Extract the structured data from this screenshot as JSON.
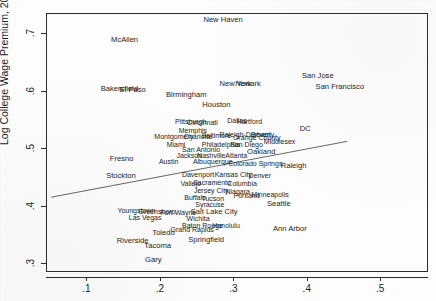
{
  "figure": {
    "kind": "scatter-with-fit-line",
    "background_color": "#fdfdfd",
    "frame_color": "#2b2b2b",
    "label_color": "#1c1c1c"
  },
  "axes": {
    "y_title": "Log College Wage Premium, 2000",
    "x_title": "",
    "x_ticks": [
      ".1",
      ".2",
      ".3",
      ".4",
      ".5"
    ],
    "y_ticks": [
      ".3",
      ".4",
      ".5",
      ".6",
      ".7"
    ]
  },
  "chart_data": {
    "type": "scatter",
    "title": "",
    "xlabel": "",
    "ylabel": "Log College Wage Premium, 2000",
    "xlim": [
      0.045,
      0.565
    ],
    "ylim": [
      0.285,
      0.735
    ],
    "xtick_values": [
      0.1,
      0.2,
      0.3,
      0.4,
      0.5
    ],
    "xtick_labels": [
      ".1",
      ".2",
      ".3",
      ".4",
      ".5"
    ],
    "ytick_values": [
      0.3,
      0.4,
      0.5,
      0.6,
      0.7
    ],
    "ytick_labels": [
      ".3",
      ".4",
      ".5",
      ".6",
      ".7"
    ],
    "grid": false,
    "legend": false,
    "marker_style": "text-label",
    "fit_line": {
      "present": true,
      "x_start": 0.052,
      "y_start": 0.415,
      "x_end": 0.455,
      "y_end": 0.512,
      "color": "#555555"
    },
    "points": [
      {
        "label": "New Haven",
        "x": 0.286,
        "y": 0.722,
        "size": 7.6
      },
      {
        "label": "McAllen",
        "x": 0.152,
        "y": 0.688,
        "size": 7.6
      },
      {
        "label": "Bakersfield",
        "x": 0.145,
        "y": 0.603,
        "size": 7.6
      },
      {
        "label": "El Paso",
        "x": 0.163,
        "y": 0.601,
        "size": 7.6
      },
      {
        "label": "San Jose",
        "x": 0.415,
        "y": 0.625,
        "size": 7.6
      },
      {
        "label": "San Francisco",
        "x": 0.445,
        "y": 0.606,
        "size": 7.6
      },
      {
        "label": "Birmingham",
        "x": 0.236,
        "y": 0.592,
        "size": 7.6
      },
      {
        "label": "New York",
        "x": 0.303,
        "y": 0.612,
        "size": 7.6
      },
      {
        "label": "Newark",
        "x": 0.32,
        "y": 0.612,
        "size": 7.6
      },
      {
        "label": "Houston",
        "x": 0.277,
        "y": 0.576,
        "size": 7.6
      },
      {
        "label": "Pittsburgh",
        "x": 0.242,
        "y": 0.548,
        "size": 7.0
      },
      {
        "label": "Cincinnati",
        "x": 0.258,
        "y": 0.545,
        "size": 7.0
      },
      {
        "label": "Dallas",
        "x": 0.305,
        "y": 0.549,
        "size": 7.0
      },
      {
        "label": "Hartford",
        "x": 0.322,
        "y": 0.548,
        "size": 7.0
      },
      {
        "label": "Memphis",
        "x": 0.245,
        "y": 0.531,
        "size": 7.0
      },
      {
        "label": "Montgomery",
        "x": 0.219,
        "y": 0.521,
        "size": 7.0
      },
      {
        "label": "Charlotte",
        "x": 0.252,
        "y": 0.522,
        "size": 7.0
      },
      {
        "label": "Baltimore",
        "x": 0.277,
        "y": 0.523,
        "size": 7.0
      },
      {
        "label": "Raleigh-Durham",
        "x": 0.316,
        "y": 0.525,
        "size": 7.0
      },
      {
        "label": "Beverly",
        "x": 0.34,
        "y": 0.524,
        "size": 7.0
      },
      {
        "label": "Middlesex",
        "x": 0.363,
        "y": 0.512,
        "size": 7.0
      },
      {
        "label": "DC",
        "x": 0.398,
        "y": 0.534,
        "size": 7.6
      },
      {
        "label": "Miami",
        "x": 0.222,
        "y": 0.508,
        "size": 7.0
      },
      {
        "label": "Philadelphia",
        "x": 0.283,
        "y": 0.508,
        "size": 7.0
      },
      {
        "label": "San Diego",
        "x": 0.318,
        "y": 0.507,
        "size": 7.0
      },
      {
        "label": "San Antonio",
        "x": 0.256,
        "y": 0.498,
        "size": 7.0
      },
      {
        "label": "Orange County",
        "x": 0.332,
        "y": 0.519,
        "size": 7.0
      },
      {
        "label": "Oakland",
        "x": 0.338,
        "y": 0.494,
        "size": 7.6
      },
      {
        "label": "Jackson",
        "x": 0.24,
        "y": 0.489,
        "size": 7.0
      },
      {
        "label": "Nashville",
        "x": 0.27,
        "y": 0.489,
        "size": 7.0
      },
      {
        "label": "Atlanta",
        "x": 0.304,
        "y": 0.489,
        "size": 7.0
      },
      {
        "label": "Austin",
        "x": 0.212,
        "y": 0.477,
        "size": 7.0
      },
      {
        "label": "Albuquerque",
        "x": 0.272,
        "y": 0.477,
        "size": 7.0
      },
      {
        "label": "Colorado Springs",
        "x": 0.33,
        "y": 0.474,
        "size": 7.0
      },
      {
        "label": "Raleigh",
        "x": 0.382,
        "y": 0.47,
        "size": 7.6
      },
      {
        "label": "Fresno",
        "x": 0.148,
        "y": 0.481,
        "size": 7.6
      },
      {
        "label": "Stockton",
        "x": 0.147,
        "y": 0.451,
        "size": 7.6
      },
      {
        "label": "Davenport",
        "x": 0.252,
        "y": 0.455,
        "size": 7.0
      },
      {
        "label": "Kansas City",
        "x": 0.3,
        "y": 0.455,
        "size": 7.0
      },
      {
        "label": "Denver",
        "x": 0.336,
        "y": 0.453,
        "size": 7.0
      },
      {
        "label": "Vallejo",
        "x": 0.242,
        "y": 0.44,
        "size": 7.0
      },
      {
        "label": "Sacramento",
        "x": 0.271,
        "y": 0.441,
        "size": 7.0
      },
      {
        "label": "Columbia",
        "x": 0.312,
        "y": 0.44,
        "size": 7.0
      },
      {
        "label": "Jersey City",
        "x": 0.27,
        "y": 0.427,
        "size": 7.0
      },
      {
        "label": "Niagara",
        "x": 0.306,
        "y": 0.426,
        "size": 7.0
      },
      {
        "label": "Portland",
        "x": 0.318,
        "y": 0.418,
        "size": 7.0
      },
      {
        "label": "Minneapolis",
        "x": 0.35,
        "y": 0.42,
        "size": 7.0
      },
      {
        "label": "Buffalo",
        "x": 0.248,
        "y": 0.415,
        "size": 7.0
      },
      {
        "label": "Tucson",
        "x": 0.272,
        "y": 0.413,
        "size": 7.0
      },
      {
        "label": "Syracuse",
        "x": 0.268,
        "y": 0.404,
        "size": 7.0
      },
      {
        "label": "Seattle",
        "x": 0.362,
        "y": 0.403,
        "size": 7.6
      },
      {
        "label": "Youngstown",
        "x": 0.168,
        "y": 0.392,
        "size": 7.0
      },
      {
        "label": "Greensboro",
        "x": 0.196,
        "y": 0.391,
        "size": 7.0
      },
      {
        "label": "Fort Wayne",
        "x": 0.225,
        "y": 0.389,
        "size": 7.0
      },
      {
        "label": "Salt Lake City",
        "x": 0.274,
        "y": 0.39,
        "size": 7.6
      },
      {
        "label": "Las Vegas",
        "x": 0.18,
        "y": 0.381,
        "size": 7.0
      },
      {
        "label": "Wichita",
        "x": 0.252,
        "y": 0.378,
        "size": 7.0
      },
      {
        "label": "Baton Rouge",
        "x": 0.258,
        "y": 0.367,
        "size": 7.0
      },
      {
        "label": "Honolulu",
        "x": 0.29,
        "y": 0.366,
        "size": 7.0
      },
      {
        "label": "Grand Rapids",
        "x": 0.244,
        "y": 0.359,
        "size": 7.0
      },
      {
        "label": "Ann Arbor",
        "x": 0.377,
        "y": 0.36,
        "size": 7.6
      },
      {
        "label": "Toledo",
        "x": 0.205,
        "y": 0.352,
        "size": 7.6
      },
      {
        "label": "Springfield",
        "x": 0.263,
        "y": 0.341,
        "size": 7.6
      },
      {
        "label": "Riverside",
        "x": 0.163,
        "y": 0.339,
        "size": 7.6
      },
      {
        "label": "Tacoma",
        "x": 0.197,
        "y": 0.33,
        "size": 7.6
      },
      {
        "label": "Gary",
        "x": 0.191,
        "y": 0.305,
        "size": 7.6
      }
    ]
  }
}
